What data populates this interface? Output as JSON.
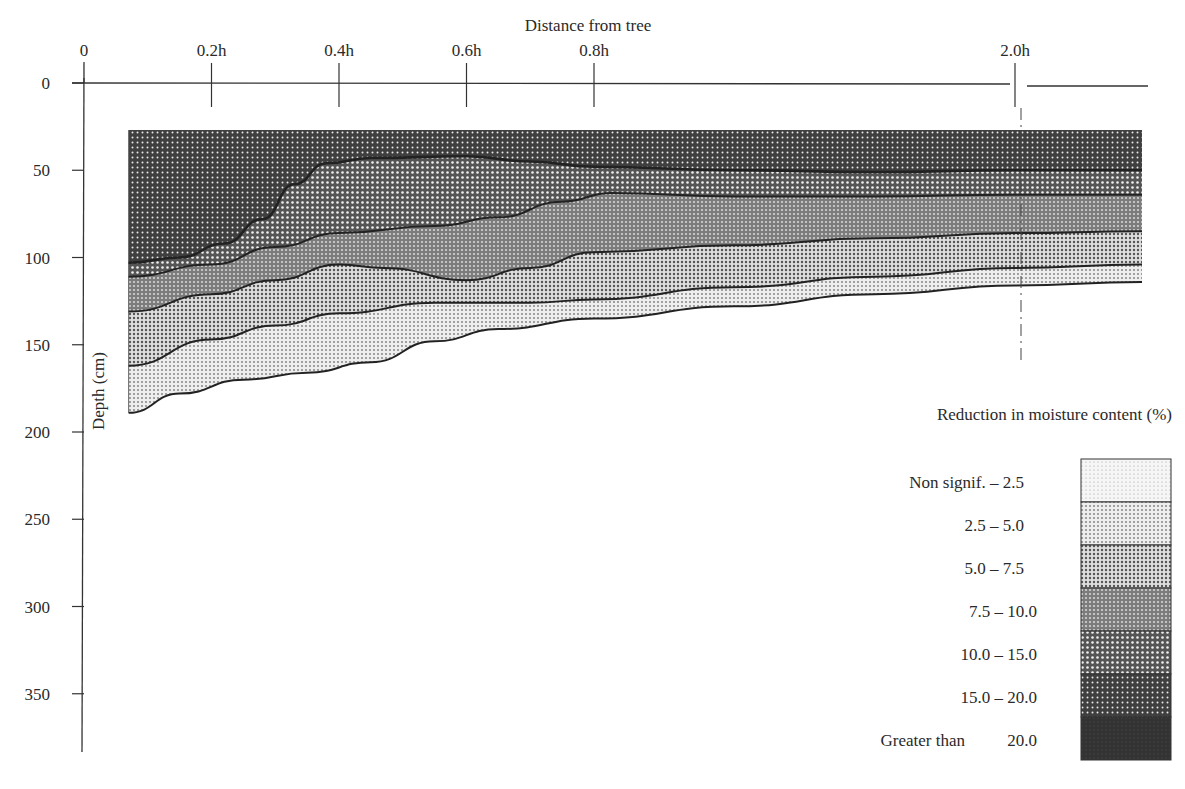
{
  "chart_data": {
    "type": "area",
    "title": "",
    "xlabel": "Distance from tree",
    "ylabel": "Depth (cm)",
    "x_ticks": [
      {
        "label": "0",
        "value": 0
      },
      {
        "label": "0.2h",
        "value": 0.2
      },
      {
        "label": "0.4h",
        "value": 0.4
      },
      {
        "label": "0.6h",
        "value": 0.6
      },
      {
        "label": "0.8h",
        "value": 0.8
      },
      {
        "label": "2.0h",
        "value": 2.0
      }
    ],
    "x_axis_break": "between 0.8h and 2.0h (axis broken just left of 2.0h)",
    "y_ticks": [
      0,
      50,
      100,
      150,
      200,
      250,
      300,
      350
    ],
    "ylim": [
      0,
      390
    ],
    "y_inverted": true,
    "grid": false,
    "legend": {
      "title": "Reduction in moisture content (%)",
      "position": "right",
      "entries": [
        {
          "label_left": "Non signif.",
          "label_right": "2.5",
          "range": "Non signif. - 2.5",
          "fill": "#ececec"
        },
        {
          "label_left": "2.5",
          "label_right": "5.0",
          "range": "2.5 - 5.0",
          "fill": "#d9d9d9"
        },
        {
          "label_left": "5.0",
          "label_right": "7.5",
          "range": "5.0 - 7.5",
          "fill": "#bdbdbd"
        },
        {
          "label_left": "7.5",
          "label_right": "10.0",
          "range": "7.5 - 10.0",
          "fill": "#8a8a8a"
        },
        {
          "label_left": "10.0",
          "label_right": "15.0",
          "range": "10.0 - 15.0",
          "fill": "#6a6a6a"
        },
        {
          "label_left": "15.0",
          "label_right": "20.0",
          "range": "15.0 - 20.0",
          "fill": "#4e4e4e"
        },
        {
          "label_left": "Greater than",
          "label_right": "20.0",
          "range": "Greater than 20.0",
          "fill": "#333333"
        }
      ]
    },
    "x_positions_px_note": "x distance in h units; points beyond 0.8h lie on compressed segment to 2.0h and past",
    "region_top_depth_cm": 27,
    "boundaries": [
      {
        "name": "bottom of 10.0-15.0 zone",
        "points": [
          [
            0.07,
            103
          ],
          [
            0.15,
            100
          ],
          [
            0.22,
            92
          ],
          [
            0.28,
            78
          ],
          [
            0.33,
            58
          ],
          [
            0.38,
            46
          ],
          [
            0.45,
            43
          ],
          [
            0.6,
            42
          ],
          [
            0.7,
            45
          ],
          [
            0.8,
            48
          ],
          [
            1.2,
            50
          ],
          [
            1.6,
            51
          ],
          [
            2.0,
            50
          ],
          [
            2.2,
            50
          ]
        ]
      },
      {
        "name": "bottom of 7.5-10.0 zone",
        "points": [
          [
            0.07,
            111
          ],
          [
            0.2,
            104
          ],
          [
            0.3,
            94
          ],
          [
            0.4,
            86
          ],
          [
            0.55,
            82
          ],
          [
            0.65,
            77
          ],
          [
            0.75,
            68
          ],
          [
            0.85,
            63
          ],
          [
            1.2,
            65
          ],
          [
            1.6,
            65
          ],
          [
            2.0,
            64
          ],
          [
            2.2,
            64
          ]
        ]
      },
      {
        "name": "bottom of 5.0-7.5 zone",
        "points": [
          [
            0.07,
            131
          ],
          [
            0.2,
            121
          ],
          [
            0.3,
            113
          ],
          [
            0.4,
            104
          ],
          [
            0.47,
            106
          ],
          [
            0.6,
            113
          ],
          [
            0.7,
            106
          ],
          [
            0.8,
            97
          ],
          [
            1.2,
            93
          ],
          [
            1.6,
            89
          ],
          [
            2.0,
            86
          ],
          [
            2.2,
            85
          ]
        ]
      },
      {
        "name": "bottom of 2.5-5.0 zone",
        "points": [
          [
            0.07,
            162
          ],
          [
            0.2,
            147
          ],
          [
            0.3,
            139
          ],
          [
            0.4,
            132
          ],
          [
            0.55,
            126
          ],
          [
            0.7,
            126
          ],
          [
            0.8,
            124
          ],
          [
            1.2,
            117
          ],
          [
            1.6,
            111
          ],
          [
            2.0,
            106
          ],
          [
            2.2,
            104
          ]
        ]
      },
      {
        "name": "bottom of Non signif.-2.5 zone",
        "points": [
          [
            0.07,
            189
          ],
          [
            0.15,
            178
          ],
          [
            0.25,
            170
          ],
          [
            0.35,
            166
          ],
          [
            0.45,
            160
          ],
          [
            0.55,
            148
          ],
          [
            0.65,
            141
          ],
          [
            0.8,
            135
          ],
          [
            1.2,
            128
          ],
          [
            1.6,
            121
          ],
          [
            2.0,
            116
          ],
          [
            2.2,
            114
          ]
        ]
      }
    ],
    "zones_top_to_bottom": [
      "15.0 - 20.0",
      "10.0 - 15.0",
      "7.5 - 10.0",
      "5.0 - 7.5",
      "2.5 - 5.0",
      "Non signif. - 2.5"
    ]
  },
  "labels": {
    "xlabel": "Distance from tree",
    "ylabel": "Depth (cm)",
    "legend_title": "Reduction in moisture content (%)"
  }
}
